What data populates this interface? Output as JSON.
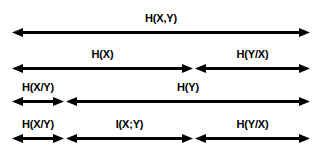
{
  "diagram": {
    "background_color": "#ffffff",
    "line_color": "#000000",
    "width": 322,
    "height": 147,
    "rows": [
      {
        "name": "joint-entropy-row",
        "y": 12,
        "segments": [
          {
            "name": "joint-entropy",
            "label": "H(X,Y)",
            "x": 12,
            "width": 298
          }
        ]
      },
      {
        "name": "hx-hygx-row",
        "y": 48,
        "segments": [
          {
            "name": "entropy-x",
            "label": "H(X)",
            "x": 12,
            "width": 181
          },
          {
            "name": "conditional-entropy-y-given-x",
            "label": "H(Y/X)",
            "x": 195,
            "width": 115
          }
        ]
      },
      {
        "name": "hxgy-hy-row",
        "y": 81,
        "segments": [
          {
            "name": "conditional-entropy-x-given-y",
            "label": "H(X/Y)",
            "x": 12,
            "width": 52
          },
          {
            "name": "entropy-y",
            "label": "H(Y)",
            "x": 66,
            "width": 244
          }
        ]
      },
      {
        "name": "decomposition-row",
        "y": 118,
        "segments": [
          {
            "name": "conditional-entropy-x-given-y",
            "label": "H(X/Y)",
            "x": 12,
            "width": 52
          },
          {
            "name": "mutual-information",
            "label": "I(X;Y)",
            "x": 66,
            "width": 127
          },
          {
            "name": "conditional-entropy-y-given-x",
            "label": "H(Y/X)",
            "x": 195,
            "width": 115
          }
        ]
      }
    ]
  }
}
